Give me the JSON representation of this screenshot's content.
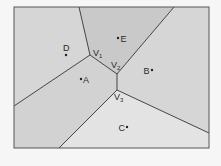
{
  "diagram": {
    "type": "voronoi",
    "frame": {
      "x": 14,
      "y": 7,
      "width": 195,
      "height": 141
    },
    "colors": {
      "background": "#f6f6f6",
      "frame_stroke": "#555555",
      "edge_stroke": "#444444",
      "region_A": "#d2d2d2",
      "region_B": "#d6d6d6",
      "region_C": "#e3e3e3",
      "region_D": "#d6d6d6",
      "region_E": "#c9c9c9",
      "point": "#222222"
    },
    "sites": [
      {
        "id": "A",
        "label": "A",
        "x": 81,
        "y": 79
      },
      {
        "id": "B",
        "label": "B",
        "x": 152,
        "y": 70
      },
      {
        "id": "C",
        "label": "C",
        "x": 127,
        "y": 127
      },
      {
        "id": "D",
        "label": "D",
        "x": 66,
        "y": 55
      },
      {
        "id": "E",
        "label": "E",
        "x": 118,
        "y": 38
      }
    ],
    "vertices": [
      {
        "id": "V1",
        "letter": "V",
        "sub": "1",
        "x": 90,
        "y": 55
      },
      {
        "id": "V2",
        "letter": "V",
        "sub": "2",
        "x": 117,
        "y": 74
      },
      {
        "id": "V3",
        "letter": "V",
        "sub": "3",
        "x": 117,
        "y": 90
      }
    ]
  }
}
